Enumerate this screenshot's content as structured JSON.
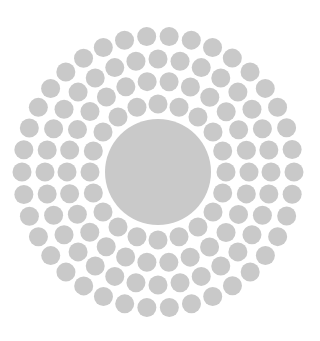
{
  "image": {
    "width": 320,
    "height": 341,
    "background": "#ffffff",
    "description": "Concentric rings of gray dots around a large central gray disc"
  },
  "pattern": {
    "center": {
      "x": 158,
      "y": 172
    },
    "dot_color": "#c9c9c9",
    "center_disc": {
      "radius": 53,
      "color": "#c9c9c9"
    },
    "dot_radius": 9.5,
    "rings": [
      {
        "radius": 68,
        "count": 20,
        "offset_deg": 0
      },
      {
        "radius": 91,
        "count": 26,
        "offset_deg": 7
      },
      {
        "radius": 113,
        "count": 32,
        "offset_deg": 0
      },
      {
        "radius": 136,
        "count": 38,
        "offset_deg": 4.7
      }
    ]
  }
}
